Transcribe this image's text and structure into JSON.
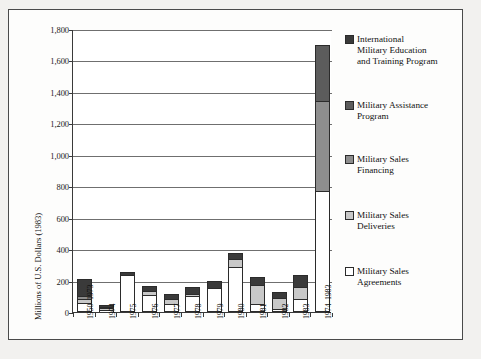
{
  "chart_data": {
    "type": "bar",
    "title": "",
    "subtitle": "",
    "stacked": true,
    "xlabel": "",
    "ylabel": "Millions of U.S. Dollars (1983)",
    "ylim": [
      0,
      1800
    ],
    "ytick_step": 200,
    "ytick_labels": [
      "0",
      "200",
      "400",
      "600",
      "800",
      "1,000",
      "1,200",
      "1,400",
      "1,600",
      "1,800"
    ],
    "ytick_values": [
      0,
      200,
      400,
      600,
      800,
      1000,
      1200,
      1400,
      1600,
      1800
    ],
    "grid": true,
    "grid_axis": "y",
    "legend_position": "right",
    "categories": [
      "1950–1973",
      "1974",
      "1975",
      "1976",
      "1977",
      "1978",
      "1979",
      "1980",
      "1981",
      "1982",
      "1983",
      "1974–1983"
    ],
    "series": [
      {
        "name": "Military Sales Agreements",
        "color": "#ffffff",
        "values": [
          45,
          2,
          220,
          98,
          36,
          88,
          140,
          276,
          38,
          4,
          70,
          755
        ]
      },
      {
        "name": "Military Sales Deliveries",
        "color": "#c8c8c8",
        "values": [
          20,
          4,
          0,
          14,
          26,
          6,
          0,
          40,
          112,
          68,
          72,
          0
        ]
      },
      {
        "name": "Military Sales Financing",
        "color": "#8e8e8e",
        "values": [
          10,
          2,
          0,
          0,
          0,
          0,
          0,
          0,
          0,
          0,
          0,
          570
        ]
      },
      {
        "name": "Military Assistance Program",
        "color": "#5c5c5c",
        "values": [
          0,
          0,
          0,
          0,
          0,
          0,
          0,
          0,
          0,
          0,
          0,
          345
        ]
      },
      {
        "name": "International Military Education and Training Program",
        "color": "#3a3a3a",
        "values": [
          105,
          6,
          15,
          26,
          30,
          40,
          40,
          34,
          45,
          30,
          65,
          0
        ]
      }
    ],
    "totals": [
      180,
      14,
      235,
      138,
      92,
      134,
      180,
      350,
      195,
      102,
      207,
      1670
    ]
  },
  "legend": {
    "items": [
      {
        "label": "International Military Education and Training Program",
        "lines": [
          "International",
          "Military Education",
          "and Training Program"
        ],
        "color": "#3a3a3a"
      },
      {
        "label": "Military Assistance Program",
        "lines": [
          "Military Assistance",
          "Program"
        ],
        "color": "#5c5c5c"
      },
      {
        "label": "Military Sales Financing",
        "lines": [
          "Military Sales",
          "Financing"
        ],
        "color": "#8e8e8e"
      },
      {
        "label": "Military Sales Deliveries",
        "lines": [
          "Military Sales",
          "Deliveries"
        ],
        "color": "#c8c8c8"
      },
      {
        "label": "Military Sales Agreements",
        "lines": [
          "Military Sales",
          "Agreements"
        ],
        "color": "#ffffff"
      }
    ]
  },
  "colors": {
    "frame_border": "#4a4a4a",
    "plot_background": "#ffffff",
    "figure_background": "#f2f1ef",
    "axis": "#3a3a3a",
    "gridline": "#6f6f6f",
    "text": "#111111"
  }
}
